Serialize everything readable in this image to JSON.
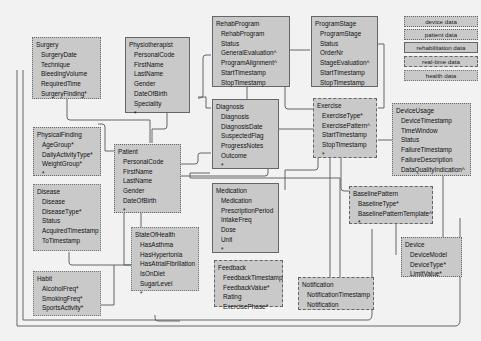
{
  "diagram": {
    "entities": [
      {
        "id": "surgery",
        "title": "Surgery",
        "category": "patient data",
        "attributes": [
          "SurgeryDate",
          "Technique",
          "BleedingVolume",
          "RequiredTime",
          "SurgeryFinding*"
        ]
      },
      {
        "id": "physiotherapist",
        "title": "Physiotherapist",
        "category": "rehabilitation data",
        "attributes": [
          "PersonalCode",
          "FirstName",
          "LastName",
          "Gender",
          "DateOfBirth",
          "Speciality",
          "*"
        ]
      },
      {
        "id": "rehabprogram",
        "title": "RehabProgram",
        "category": "rehabilitation data",
        "attributes": [
          "RehabProgram",
          "Status",
          "GeneralEvaluation^",
          "ProgramAlignment^",
          "StartTimestamp",
          "StopTimestamp"
        ]
      },
      {
        "id": "programstage",
        "title": "ProgramStage",
        "category": "rehabilitation data",
        "attributes": [
          "ProgramStage",
          "Status",
          "OrderNr",
          "StageEvaluation^",
          "StartTimestamp",
          "StopTimestamp"
        ]
      },
      {
        "id": "physicalfinding",
        "title": "PhysicalFinding",
        "category": "patient data",
        "attributes": [
          "AgeGroup*",
          "DailyActivityType*",
          "WeightGroup*",
          "*"
        ]
      },
      {
        "id": "patient",
        "title": "Patient",
        "category": "patient data",
        "attributes": [
          "PersonalCode",
          "FirstName",
          "LastName",
          "Gender",
          "DateOfBirth",
          "*"
        ]
      },
      {
        "id": "diagnosis",
        "title": "Diagnosis",
        "category": "rehabilitation data",
        "attributes": [
          "Diagnosis",
          "DiagnosisDate",
          "SuspectedFlag",
          "ProgressNotes",
          "Outcome",
          "*"
        ]
      },
      {
        "id": "exercise",
        "title": "Exercise",
        "category": "real-time data",
        "attributes": [
          "ExerciseType*",
          "ExercisePattern^",
          "StartTimestamp",
          "StopTimestamp",
          "*"
        ]
      },
      {
        "id": "deviceusage",
        "title": "DeviceUsage",
        "category": "device data",
        "attributes": [
          "DeviceTimestamp",
          "TimeWindow",
          "Status",
          "FailureTimestamp",
          "FailureDescription",
          "DataQualityIndication^"
        ]
      },
      {
        "id": "disease",
        "title": "Disease",
        "category": "health data",
        "attributes": [
          "Disease",
          "DiseaseType*",
          "Status",
          "AcquiredTimestamp",
          "ToTimestamp"
        ]
      },
      {
        "id": "medication",
        "title": "Medication",
        "category": "rehabilitation data",
        "attributes": [
          "Medication",
          "PrescriptionPeriod",
          "IntakeFreq",
          "Dose",
          "Unit",
          "*"
        ]
      },
      {
        "id": "baselinepattern",
        "title": "BaselinePattern",
        "category": "real-time data",
        "attributes": [
          "BaselineType*",
          "BaselinePatternTemplate^",
          "*"
        ]
      },
      {
        "id": "stateofhealth",
        "title": "StateOfHealth",
        "category": "health data",
        "attributes": [
          "HasAsthma",
          "HasHypertonia",
          "HasAtrialFibrillation",
          "IsOnDiet",
          "SugarLevel",
          "*"
        ]
      },
      {
        "id": "habit",
        "title": "Habit",
        "category": "health data",
        "attributes": [
          "AlcoholFreq*",
          "SmokingFreq*",
          "SportsActivity*"
        ]
      },
      {
        "id": "feedback",
        "title": "Feedback",
        "category": "real-time data",
        "attributes": [
          "FeedbackTimestamp",
          "FeedbackValue*",
          "Rating",
          "ExercisePhase*"
        ]
      },
      {
        "id": "notification",
        "title": "Notification",
        "category": "real-time data",
        "attributes": [
          "NotificationTimestamp",
          "Notification"
        ]
      },
      {
        "id": "device",
        "title": "Device",
        "category": "device data",
        "attributes": [
          "DeviceModel",
          "DeviceType*",
          "LimitValue*"
        ]
      }
    ]
  },
  "legend": {
    "items": [
      {
        "label": "device data",
        "style": "dotted"
      },
      {
        "label": "patient data",
        "style": "dotted"
      },
      {
        "label": "rehabilitation data",
        "style": "solid"
      },
      {
        "label": "real-time data",
        "style": "dashed"
      },
      {
        "label": "health data",
        "style": "dotted"
      }
    ]
  },
  "colors": {
    "background": "#f2f2f2",
    "entity_fill": "#c9c9c9",
    "line": "#555555"
  }
}
